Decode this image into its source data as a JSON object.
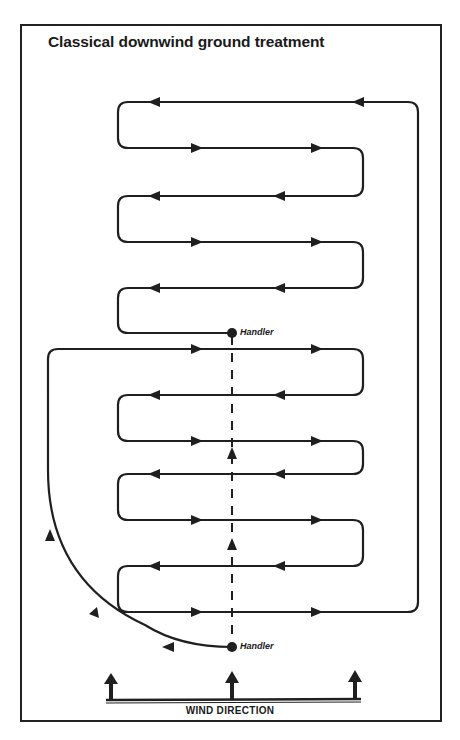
{
  "title": "Classical downwind ground treatment",
  "handlers": [
    {
      "label": "Handler",
      "position": "upper"
    },
    {
      "label": "Handler",
      "position": "lower"
    }
  ],
  "wind": {
    "label": "WIND DIRECTION",
    "arrow_count": 3
  },
  "colors": {
    "line": "#1f1f1f",
    "background": "#ffffff"
  }
}
